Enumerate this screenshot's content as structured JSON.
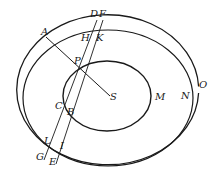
{
  "diagram": {
    "type": "orbital geometry figure",
    "labels": {
      "A": "A",
      "D": "D",
      "F": "F",
      "H": "H",
      "K": "K",
      "P": "P",
      "S": "S",
      "M": "M",
      "N": "N",
      "O": "O",
      "C": "C",
      "B": "B",
      "L": "L",
      "I": "I",
      "G": "G",
      "E": "E"
    },
    "stroke_color": "#1a1a1a",
    "background": "#ffffff"
  }
}
